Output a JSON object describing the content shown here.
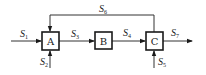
{
  "diagram": {
    "type": "process-flow",
    "units": [
      {
        "id": "A",
        "label": "A"
      },
      {
        "id": "B",
        "label": "B"
      },
      {
        "id": "C",
        "label": "C"
      }
    ],
    "streams": [
      {
        "id": "S1",
        "symbol": "S",
        "sub": "1",
        "from": "feed",
        "to": "A"
      },
      {
        "id": "S2",
        "symbol": "S",
        "sub": "2",
        "from": "feed-bottom",
        "to": "A"
      },
      {
        "id": "S3",
        "symbol": "S",
        "sub": "3",
        "from": "A",
        "to": "B"
      },
      {
        "id": "S4",
        "symbol": "S",
        "sub": "4",
        "from": "B",
        "to": "C"
      },
      {
        "id": "S5",
        "symbol": "S",
        "sub": "5",
        "from": "feed-bottom",
        "to": "C"
      },
      {
        "id": "S6",
        "symbol": "S",
        "sub": "6",
        "from": "C",
        "to": "A",
        "kind": "recycle"
      },
      {
        "id": "S7",
        "symbol": "S",
        "sub": "7",
        "from": "C",
        "to": "product"
      }
    ],
    "colors": {
      "stroke": "#1a1a1a",
      "background": "#ffffff"
    }
  }
}
